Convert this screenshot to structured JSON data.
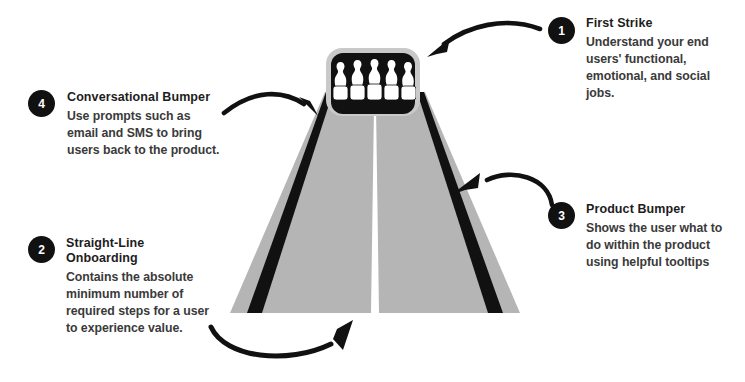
{
  "diagram": {
    "type": "bowling-lane-perspective",
    "colors": {
      "lane_gray": "#b5b5b5",
      "gutter_black": "#111111",
      "pin_white": "#ffffff",
      "badge_black": "#111111",
      "title_text": "#1d1d1d",
      "body_text": "#3a3a3a",
      "background": "#ffffff"
    },
    "lane": {
      "pin_count": 5,
      "center_line": true,
      "gutters": 2
    }
  },
  "callouts": [
    {
      "number": "1",
      "title": "First Strike",
      "body": "Understand your end\nusers' functional,\nemotional, and social\njobs.",
      "points_to": "pins"
    },
    {
      "number": "4",
      "title": "Conversational Bumper",
      "body": "Use prompts such as\nemail and SMS to bring\nusers back to the product.",
      "points_to": "left-gutter"
    },
    {
      "number": "2",
      "title": "Straight-Line\nOnboarding",
      "body": "Contains the absolute\nminimum number of\nrequired steps for a user\nto experience value.",
      "points_to": "lane-bottom"
    },
    {
      "number": "3",
      "title": "Product Bumper",
      "body": "Shows the user what to\ndo within the product\nusing helpful tooltips",
      "points_to": "right-gutter"
    }
  ]
}
